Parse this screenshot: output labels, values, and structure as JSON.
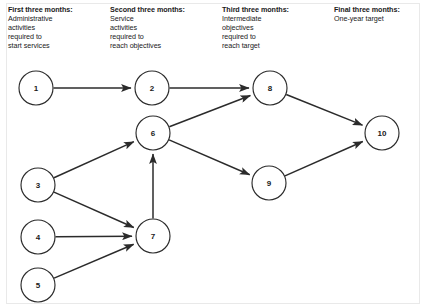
{
  "diagram": {
    "type": "project-network-diagram",
    "headers": [
      {
        "id": "first-three-months",
        "title": "First three months:",
        "lines": [
          "Administrative",
          "activities",
          "required to",
          "start services"
        ]
      },
      {
        "id": "second-three-months",
        "title": "Second three months:",
        "lines": [
          "Service",
          "activities",
          "required to",
          "reach objectives"
        ]
      },
      {
        "id": "third-three-months",
        "title": "Third three months:",
        "lines": [
          "Intermediate",
          "objectives",
          "required to",
          "reach target"
        ]
      },
      {
        "id": "final-three-months",
        "title": "Final three months:",
        "lines": [
          "One-year target"
        ]
      }
    ],
    "nodes": [
      {
        "id": "1",
        "label": "1",
        "cx": 36,
        "cy": 88,
        "r": 17
      },
      {
        "id": "2",
        "label": "2",
        "cx": 152,
        "cy": 88,
        "r": 17
      },
      {
        "id": "8",
        "label": "8",
        "cx": 270,
        "cy": 88,
        "r": 17
      },
      {
        "id": "6",
        "label": "6",
        "cx": 153,
        "cy": 133,
        "r": 17
      },
      {
        "id": "10",
        "label": "10",
        "cx": 382,
        "cy": 133,
        "r": 17
      },
      {
        "id": "9",
        "label": "9",
        "cx": 269,
        "cy": 183,
        "r": 17
      },
      {
        "id": "3",
        "label": "3",
        "cx": 38,
        "cy": 185,
        "r": 17
      },
      {
        "id": "4",
        "label": "4",
        "cx": 38,
        "cy": 237,
        "r": 17
      },
      {
        "id": "7",
        "label": "7",
        "cx": 153,
        "cy": 236,
        "r": 17
      },
      {
        "id": "5",
        "label": "5",
        "cx": 38,
        "cy": 285,
        "r": 17
      }
    ],
    "edges": [
      {
        "id": "edge-1-2",
        "from": "1",
        "to": "2"
      },
      {
        "id": "edge-2-8",
        "from": "2",
        "to": "8"
      },
      {
        "id": "edge-6-8",
        "from": "6",
        "to": "8"
      },
      {
        "id": "edge-6-9",
        "from": "6",
        "to": "9"
      },
      {
        "id": "edge-8-10",
        "from": "8",
        "to": "10"
      },
      {
        "id": "edge-9-10",
        "from": "9",
        "to": "10"
      },
      {
        "id": "edge-3-6",
        "from": "3",
        "to": "6"
      },
      {
        "id": "edge-7-6",
        "from": "7",
        "to": "6"
      },
      {
        "id": "edge-3-7",
        "from": "3",
        "to": "7"
      },
      {
        "id": "edge-4-7",
        "from": "4",
        "to": "7"
      },
      {
        "id": "edge-5-7",
        "from": "5",
        "to": "7"
      }
    ],
    "colors": {
      "stroke": "#2b2b2b",
      "node_fill": "#ffffff",
      "text": "#1a1a1a",
      "background": "#ffffff",
      "frame": "#e9e9e9"
    }
  }
}
